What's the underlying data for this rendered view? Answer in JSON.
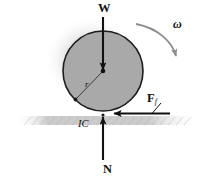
{
  "figure": {
    "background_color": "#ffffff"
  },
  "labels": {
    "weight": "W",
    "angular_velocity": "ω",
    "friction_force_main": "F",
    "friction_force_subscript": "f",
    "instant_center": "IC",
    "normal_force": "N",
    "radius": "r"
  },
  "colors": {
    "wheel_fill": "#a9a9a9",
    "wheel_stroke": "#1a1a1a",
    "ground_line": "#555555",
    "shadow": "#c9c9c9",
    "arrow": "#111111",
    "omega_arrow": "#8a8a8a",
    "text": "#111111"
  },
  "geometry": {
    "wheel_center_x": 103,
    "wheel_center_y": 71,
    "wheel_radius": 40,
    "ground_y": 115,
    "ground_x_start": 14,
    "ground_x_end": 201,
    "contact_point_x": 103,
    "contact_point_y": 115
  },
  "vectors": [
    {
      "name": "weight",
      "label": "W",
      "direction": "down",
      "tail": [
        103,
        16
      ],
      "tip": [
        103,
        71
      ],
      "description": "weight force acting downward at center of wheel"
    },
    {
      "name": "normal-force",
      "label": "N",
      "direction": "up",
      "tail": [
        103,
        160
      ],
      "tip": [
        103,
        116
      ],
      "description": "normal reaction force acting upward at contact point"
    },
    {
      "name": "friction-force",
      "label": "Ff",
      "direction": "left",
      "tail": [
        170,
        113
      ],
      "tip": [
        112,
        113
      ],
      "description": "friction force acting leftward at contact point"
    },
    {
      "name": "angular-velocity",
      "label": "ω",
      "direction": "clockwise",
      "description": "curved arrow indicating clockwise angular velocity"
    },
    {
      "name": "radius",
      "label": "r",
      "direction": "down-left",
      "tail": [
        103,
        71
      ],
      "tip": [
        75,
        100
      ],
      "description": "radius line from center toward lower-left of wheel"
    }
  ]
}
